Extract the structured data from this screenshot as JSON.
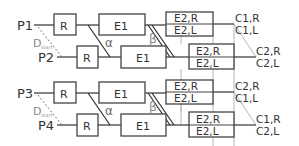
{
  "groups": [
    {
      "inputs": {
        "top": "P1",
        "bottom": "P2"
      },
      "distance_label": "D",
      "distance_sub": "start",
      "stage1": "R",
      "stage2": "E1",
      "alpha": "α",
      "beta": "β",
      "e2_top": {
        "r": "E2,R",
        "l": "E2,L"
      },
      "e2_bottom": {
        "r": "E2,R",
        "l": "E2,L"
      },
      "outputs_top": {
        "r": "C1,R",
        "l": "C1,L"
      },
      "outputs_bottom": {
        "r": "C2,R",
        "l": "C2,L"
      }
    },
    {
      "inputs": {
        "top": "P3",
        "bottom": "P4"
      },
      "distance_label": "D",
      "distance_sub": "start",
      "stage1": "R",
      "stage2": "E1",
      "alpha": "α",
      "beta": "β",
      "e2_top": {
        "r": "E2,R",
        "l": "E2,L"
      },
      "e2_bottom": {
        "r": "E2,R",
        "l": "E2,L"
      },
      "outputs_top": {
        "r": "C2,R",
        "l": "C1,L"
      },
      "outputs_bottom": {
        "r": "C1,R",
        "l": "C2,L"
      }
    }
  ],
  "colors": {
    "line": "#333333",
    "box": "#444444",
    "light_line": "#aaaaaa",
    "dashed": "#777777",
    "text": "#333333"
  }
}
